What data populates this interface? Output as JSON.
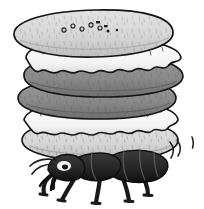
{
  "illustration": {
    "title": "Ant carrying a stack of cream-filled sandwich cookies",
    "subject": "ant",
    "background_color": "#ffffff",
    "outline_color": "#111111",
    "caption": "",
    "style": "cartoon line drawing, grayscale"
  },
  "palette": {
    "background": "#ffffff",
    "outline": "#141414",
    "cookie_light": "#d9d9d9",
    "cookie_light_shade": "#c2c2c2",
    "cookie_dark": "#8b8b8b",
    "cookie_dark_shade": "#777777",
    "cream_white": "#fbfbfb",
    "cream_shade": "#e2e2e2",
    "ant_body": "#2b2b2b",
    "ant_body_dark": "#141414",
    "ant_highlight": "#f2f2f2",
    "texture_mark": "#3a3a3a"
  },
  "stack": {
    "label": "cookie-stack",
    "layer_count": 6,
    "layers": [
      {
        "id": "cookie-top",
        "type": "cookie",
        "shade": "light",
        "label": "Top cookie with holes",
        "tilt_deg": -6,
        "has_dots": true
      },
      {
        "id": "cream-upper",
        "type": "cream",
        "shade": "white",
        "label": "Upper cream filling",
        "tilt_deg": -4,
        "has_dots": false
      },
      {
        "id": "cookie-dark-upper",
        "type": "cookie",
        "shade": "dark",
        "label": "Upper dark cookie",
        "tilt_deg": -3,
        "has_dots": false
      },
      {
        "id": "cookie-dark-lower",
        "type": "cookie",
        "shade": "dark",
        "label": "Lower dark cookie",
        "tilt_deg": 3,
        "has_dots": false
      },
      {
        "id": "cream-lower",
        "type": "cream",
        "shade": "white",
        "label": "Lower cream filling",
        "tilt_deg": 2,
        "has_dots": false
      },
      {
        "id": "cookie-bottom",
        "type": "cookie",
        "shade": "light",
        "label": "Bottom cookie",
        "tilt_deg": 2,
        "has_dots": false
      }
    ],
    "top_dot_count": 9
  },
  "ant": {
    "label": "ant",
    "facing": "left",
    "leg_count": 6,
    "antenna_count": 2,
    "body_parts": [
      "head",
      "thorax",
      "abdomen"
    ],
    "eye_highlight": true
  },
  "motion": {
    "label": "motion-lines",
    "count": 3,
    "side": "right",
    "description": "wobble marks beside the abdomen"
  }
}
